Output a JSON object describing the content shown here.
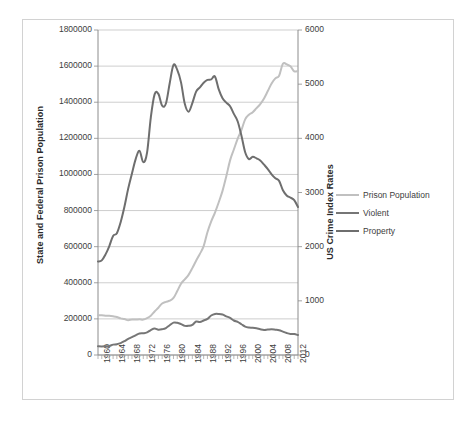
{
  "chart_data": {
    "type": "line",
    "title": "",
    "xlabel": "",
    "ylabel": "State and Federal Prison Population",
    "y2label": "US Crime Index Rates",
    "grid": true,
    "legend_position": "right",
    "xlim": [
      1960,
      2013
    ],
    "ylim": [
      0,
      1800000
    ],
    "y2lim": [
      0,
      6000
    ],
    "y_ticks": [
      "0",
      "200000",
      "400000",
      "600000",
      "800000",
      "1000000",
      "1200000",
      "1400000",
      "1600000",
      "1800000"
    ],
    "y2_ticks": [
      "0",
      "1000",
      "2000",
      "3000",
      "4000",
      "5000",
      "6000"
    ],
    "x_ticks": [
      "1960",
      "1964",
      "1968",
      "1972",
      "1976",
      "1980",
      "1984",
      "1988",
      "1992",
      "1996",
      "2000",
      "2004",
      "2008",
      "2012"
    ],
    "x": [
      1960,
      1961,
      1962,
      1963,
      1964,
      1965,
      1966,
      1967,
      1968,
      1969,
      1970,
      1971,
      1972,
      1973,
      1974,
      1975,
      1976,
      1977,
      1978,
      1979,
      1980,
      1981,
      1982,
      1983,
      1984,
      1985,
      1986,
      1987,
      1988,
      1989,
      1990,
      1991,
      1992,
      1993,
      1994,
      1995,
      1996,
      1997,
      1998,
      1999,
      2000,
      2001,
      2002,
      2003,
      2004,
      2005,
      2006,
      2007,
      2008,
      2009,
      2010,
      2011,
      2012,
      2013
    ],
    "series": [
      {
        "name": "Prison Population",
        "axis": "left",
        "color": "#c0c0c0",
        "values": [
          220000,
          220000,
          218000,
          217000,
          214000,
          210000,
          203000,
          199000,
          193000,
          197000,
          196000,
          198000,
          196000,
          204000,
          218000,
          241000,
          262000,
          285000,
          294000,
          301000,
          316000,
          354000,
          395000,
          419000,
          444000,
          481000,
          522000,
          560000,
          603000,
          680000,
          740000,
          789000,
          846000,
          909000,
          990000,
          1078000,
          1138000,
          1197000,
          1246000,
          1305000,
          1331000,
          1345000,
          1367000,
          1390000,
          1421000,
          1462000,
          1504000,
          1532000,
          1547000,
          1613000,
          1610000,
          1599000,
          1571000,
          1574000
        ]
      },
      {
        "name": "Violent",
        "axis": "right",
        "color": "#767676",
        "values": [
          161,
          158,
          162,
          168,
          191,
          200,
          220,
          254,
          298,
          329,
          364,
          396,
          401,
          417,
          461,
          488,
          468,
          476,
          498,
          549,
          597,
          594,
          571,
          538,
          539,
          557,
          618,
          610,
          637,
          666,
          730,
          758,
          758,
          747,
          714,
          685,
          637,
          611,
          568,
          523,
          507,
          504,
          494,
          476,
          463,
          469,
          474,
          467,
          458,
          432,
          405,
          387,
          387,
          368
        ]
      },
      {
        "name": "Property",
        "axis": "right",
        "color": "#6e6e6e",
        "values": [
          1726,
          1747,
          1857,
          2012,
          2198,
          2249,
          2451,
          2736,
          3071,
          3351,
          3621,
          3769,
          3561,
          3737,
          4389,
          4811,
          4820,
          4602,
          4643,
          5017,
          5353,
          5264,
          5033,
          4637,
          4492,
          4651,
          4863,
          4940,
          5027,
          5078,
          5088,
          5140,
          4903,
          4740,
          4660,
          4591,
          4451,
          4316,
          4052,
          3744,
          3618,
          3658,
          3631,
          3591,
          3514,
          3432,
          3335,
          3264,
          3215,
          3041,
          2946,
          2905,
          2859,
          2731
        ]
      }
    ]
  },
  "legend": {
    "items": [
      {
        "label": "Prison Population",
        "color": "#c0c0c0"
      },
      {
        "label": "Violent",
        "color": "#767676"
      },
      {
        "label": "Property",
        "color": "#6e6e6e"
      }
    ]
  }
}
